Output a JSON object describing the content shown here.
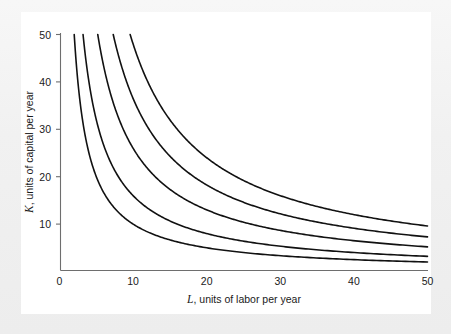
{
  "figure": {
    "kind": "isoquant-map",
    "background_color": "#f1f1f1",
    "plate_color": "#ffffff",
    "curve_color": "#111111",
    "axis_color": "#6e6e6e"
  },
  "chart_data": {
    "type": "line",
    "title": "",
    "subtitle": "",
    "xlabel_italic": "L",
    "xlabel_rest": ", units of labor per year",
    "ylabel_italic": "K",
    "ylabel_rest": ", units of capital per year",
    "xlabel": "L, units of labor per year",
    "ylabel": "K, units of capital per year",
    "xlim": [
      0,
      51
    ],
    "ylim": [
      0,
      52
    ],
    "xticks": [
      0,
      10,
      20,
      30,
      40,
      50
    ],
    "xtick_labels": [
      "0",
      "10",
      "20",
      "30",
      "40",
      "50"
    ],
    "yticks": [
      10,
      20,
      30,
      40,
      50
    ],
    "ytick_labels": [
      "10",
      "20",
      "30",
      "40",
      "50"
    ],
    "grid": false,
    "legend": "none",
    "curve_form": "K = c / L",
    "series": [
      {
        "name": "isoquant-1",
        "constant": 100,
        "x": [
          2.0,
          2.5,
          3,
          4,
          5,
          6,
          8,
          10,
          12.5,
          15,
          20,
          25,
          30,
          35,
          40,
          45,
          50
        ],
        "values": [
          50.0,
          40.0,
          33.3,
          25.0,
          20.0,
          16.7,
          12.5,
          10.0,
          8.0,
          6.7,
          5.0,
          4.0,
          3.3,
          2.9,
          2.5,
          2.2,
          2.0
        ]
      },
      {
        "name": "isoquant-2",
        "constant": 160,
        "x": [
          3.2,
          4,
          5,
          6,
          8,
          10,
          12.5,
          15,
          20,
          25,
          30,
          35,
          40,
          45,
          50
        ],
        "values": [
          50.0,
          40.0,
          32.0,
          26.7,
          20.0,
          16.0,
          12.8,
          10.7,
          8.0,
          6.4,
          5.3,
          4.6,
          4.0,
          3.6,
          3.2
        ]
      },
      {
        "name": "isoquant-3",
        "constant": 260,
        "x": [
          5.2,
          6,
          8,
          10,
          12.5,
          15,
          20,
          25,
          30,
          35,
          40,
          45,
          50
        ],
        "values": [
          50.0,
          43.3,
          32.5,
          26.0,
          20.8,
          17.3,
          13.0,
          10.4,
          8.7,
          7.4,
          6.5,
          5.8,
          5.2
        ]
      },
      {
        "name": "isoquant-4",
        "constant": 365,
        "x": [
          7.3,
          8,
          10,
          12.5,
          15,
          20,
          25,
          30,
          35,
          40,
          45,
          50
        ],
        "values": [
          50.0,
          45.6,
          36.5,
          29.2,
          24.3,
          18.3,
          14.6,
          12.2,
          10.4,
          9.1,
          8.1,
          7.3
        ]
      },
      {
        "name": "isoquant-5",
        "constant": 480,
        "x": [
          9.6,
          10,
          12.5,
          15,
          20,
          25,
          30,
          35,
          40,
          45,
          50
        ],
        "values": [
          50.0,
          48.0,
          38.4,
          32.0,
          24.0,
          19.2,
          16.0,
          13.7,
          12.0,
          10.7,
          9.6
        ]
      }
    ]
  }
}
